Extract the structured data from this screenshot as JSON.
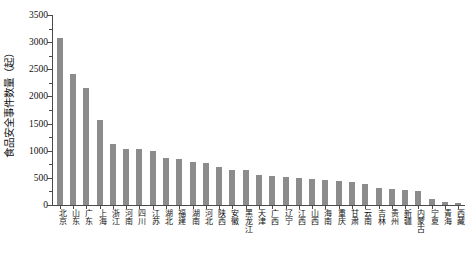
{
  "chart_data": {
    "type": "bar",
    "title": "",
    "xlabel": "",
    "ylabel": "食品安全事件数量（起）",
    "ylim": [
      0,
      3500
    ],
    "ytick_values": [
      0,
      500,
      1000,
      1500,
      2000,
      2500,
      3000,
      3500
    ],
    "ytick_labels": [
      "0",
      "500",
      "1000",
      "1500",
      "2000",
      "2500",
      "3000",
      "3500"
    ],
    "yminor_step": 250,
    "grid": false,
    "legend": null,
    "bar_color": "#8c8c8c",
    "axis_color": "#4a4a4a",
    "categories": [
      "北京",
      "山东",
      "广东",
      "上海",
      "浙江",
      "河南",
      "四川",
      "江苏",
      "湖北",
      "福建",
      "湖南",
      "河北",
      "陕西",
      "安徽",
      "黑龙江",
      "天津",
      "广西",
      "辽宁",
      "江西",
      "山西",
      "海南",
      "重庆",
      "甘肃",
      "云南",
      "吉林",
      "贵州",
      "新疆",
      "内蒙古",
      "宁夏",
      "青海",
      "西藏"
    ],
    "values": [
      3080,
      2420,
      2150,
      1570,
      1120,
      1040,
      1030,
      990,
      860,
      840,
      800,
      780,
      700,
      650,
      640,
      560,
      540,
      520,
      500,
      480,
      470,
      450,
      430,
      390,
      310,
      300,
      280,
      250,
      110,
      60,
      35
    ]
  }
}
